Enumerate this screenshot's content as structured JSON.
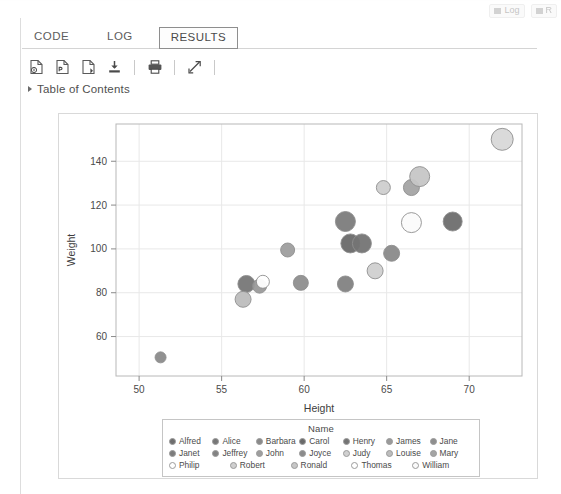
{
  "window": {
    "top_right_items": [
      "Log",
      "R"
    ]
  },
  "tabs": [
    {
      "label": "CODE",
      "active": false
    },
    {
      "label": "LOG",
      "active": false
    },
    {
      "label": "RESULTS",
      "active": true
    }
  ],
  "toolbar": {
    "buttons": [
      {
        "name": "download-html-icon",
        "title": "Download results as HTML"
      },
      {
        "name": "download-pdf-icon",
        "title": "Download results as PDF"
      },
      {
        "name": "download-rtf-icon",
        "title": "Download results as RTF"
      },
      {
        "name": "save-icon",
        "title": "Download"
      },
      {
        "name": "print-icon",
        "title": "Print"
      },
      {
        "name": "expand-icon",
        "title": "Maximize view"
      }
    ]
  },
  "toc": {
    "label": "Table of Contents",
    "expanded": false
  },
  "chart_data": {
    "type": "scatter",
    "title": "",
    "xlabel": "Height",
    "ylabel": "Weight",
    "xlim": [
      48.6,
      73.2
    ],
    "ylim": [
      42,
      157
    ],
    "xticks": [
      50,
      55,
      60,
      65,
      70
    ],
    "yticks": [
      60,
      80,
      100,
      120,
      140
    ],
    "grid": true,
    "legend_position": "bottom-inside",
    "legend_title": "Name",
    "legend_entries": [
      {
        "label": "Alfred",
        "color": "#6e6e6e"
      },
      {
        "label": "Alice",
        "color": "#777777"
      },
      {
        "label": "Barbara",
        "color": "#8a8a8a"
      },
      {
        "label": "Carol",
        "color": "#6a6a6a"
      },
      {
        "label": "Henry",
        "color": "#747474"
      },
      {
        "label": "James",
        "color": "#9a9a9a"
      },
      {
        "label": "Jane",
        "color": "#8e8e8e"
      },
      {
        "label": "Janet",
        "color": "#7c7c7c"
      },
      {
        "label": "Jeffrey",
        "color": "#828282"
      },
      {
        "label": "John",
        "color": "#9e9e9e"
      },
      {
        "label": "Joyce",
        "color": "#8b8b8b"
      },
      {
        "label": "Judy",
        "color": "#d0d0d0"
      },
      {
        "label": "Louise",
        "color": "#bdbdbd"
      },
      {
        "label": "Mary",
        "color": "#a4a4a4"
      },
      {
        "label": "Philip",
        "color": "#ffffff"
      },
      {
        "label": "Robert",
        "color": "#cfcfcf"
      },
      {
        "label": "Ronald",
        "color": "#c6c6c6"
      },
      {
        "label": "Thomas",
        "color": "#ffffff"
      },
      {
        "label": "William",
        "color": "#fafafa"
      }
    ],
    "points": [
      {
        "name": "Alfred",
        "x": 69.0,
        "y": 112.5,
        "r": 9.5,
        "color": "#6e6e6e"
      },
      {
        "name": "Alice",
        "x": 56.5,
        "y": 84.0,
        "r": 8.5,
        "color": "#777777"
      },
      {
        "name": "Barbara",
        "x": 65.3,
        "y": 98.0,
        "r": 8.0,
        "color": "#8a8a8a"
      },
      {
        "name": "Carol",
        "x": 62.8,
        "y": 102.5,
        "r": 9.5,
        "color": "#6a6a6a"
      },
      {
        "name": "Henry",
        "x": 63.5,
        "y": 102.5,
        "r": 9.5,
        "color": "#747474"
      },
      {
        "name": "James",
        "x": 57.3,
        "y": 83.0,
        "r": 7.0,
        "color": "#9a9a9a"
      },
      {
        "name": "Jane",
        "x": 59.8,
        "y": 84.5,
        "r": 7.5,
        "color": "#8e8e8e"
      },
      {
        "name": "Janet",
        "x": 62.5,
        "y": 112.5,
        "r": 10.0,
        "color": "#7c7c7c"
      },
      {
        "name": "Jeffrey",
        "x": 62.5,
        "y": 84.0,
        "r": 8.0,
        "color": "#828282"
      },
      {
        "name": "John",
        "x": 59.0,
        "y": 99.5,
        "r": 7.0,
        "color": "#9e9e9e"
      },
      {
        "name": "Joyce",
        "x": 51.3,
        "y": 50.5,
        "r": 5.5,
        "color": "#8b8b8b"
      },
      {
        "name": "Judy",
        "x": 64.3,
        "y": 90.0,
        "r": 8.0,
        "color": "#d0d0d0"
      },
      {
        "name": "Louise",
        "x": 56.3,
        "y": 77.0,
        "r": 8.0,
        "color": "#bdbdbd"
      },
      {
        "name": "Mary",
        "x": 66.5,
        "y": 128.0,
        "r": 8.0,
        "color": "#a4a4a4"
      },
      {
        "name": "Philip",
        "x": 72.0,
        "y": 150.0,
        "r": 11.0,
        "color": "#d8d8d8"
      },
      {
        "name": "Robert",
        "x": 64.8,
        "y": 128.0,
        "r": 7.0,
        "color": "#cfcfcf"
      },
      {
        "name": "Ronald",
        "x": 67.0,
        "y": 133.0,
        "r": 10.0,
        "color": "#c6c6c6"
      },
      {
        "name": "Thomas",
        "x": 57.5,
        "y": 85.0,
        "r": 6.5,
        "color": "#ffffff"
      },
      {
        "name": "William",
        "x": 66.5,
        "y": 112.0,
        "r": 10.0,
        "color": "#fbfbfb"
      }
    ]
  }
}
